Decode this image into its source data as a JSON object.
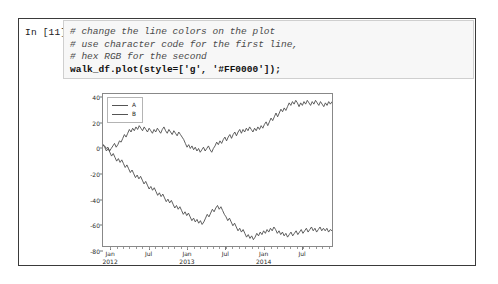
{
  "notebook": {
    "prompt_label": "In [11]:",
    "code": {
      "line1": "# change the line colors on the plot",
      "line2": "# use character code for the first line,",
      "line3": "# hex RGB for the second",
      "line4": "walk_df.plot(style=['g', '#FF0000']);"
    }
  },
  "chart_data": {
    "type": "line",
    "title": "",
    "xlabel": "",
    "ylabel": "",
    "ylim": [
      -80,
      40
    ],
    "yticks": [
      40,
      20,
      0,
      -20,
      -40,
      -60,
      -80
    ],
    "ytick_labels": [
      "40",
      "20",
      "0",
      "-20",
      "-40",
      "-60",
      "-80"
    ],
    "grid": false,
    "legend_position": "upper left",
    "xtick_labels": [
      "Jan\n2012",
      "Jul",
      "Jan\n2013",
      "Jul",
      "Jan\n2014",
      "Jul"
    ],
    "xtick_positions": [
      0.035,
      0.202,
      0.368,
      0.534,
      0.7,
      0.866
    ],
    "series": [
      {
        "name": "A",
        "color": "#4d4d4d",
        "values": [
          0,
          -1,
          -3,
          -2,
          -5,
          -3,
          -1,
          1,
          -2,
          0,
          3,
          2,
          5,
          8,
          6,
          9,
          12,
          10,
          13,
          11,
          14,
          12,
          15,
          13,
          11,
          14,
          12,
          10,
          13,
          11,
          9,
          12,
          10,
          13,
          11,
          9,
          12,
          14,
          11,
          9,
          12,
          10,
          8,
          11,
          9,
          7,
          10,
          8,
          6,
          4,
          1,
          -2,
          0,
          -3,
          -1,
          -4,
          -2,
          -5,
          -3,
          -6,
          -4,
          -2,
          -5,
          -3,
          -1,
          -4,
          -6,
          -3,
          -1,
          2,
          0,
          3,
          1,
          4,
          6,
          3,
          6,
          8,
          5,
          8,
          10,
          7,
          10,
          12,
          9,
          12,
          10,
          13,
          11,
          14,
          12,
          10,
          13,
          11,
          14,
          12,
          15,
          13,
          16,
          18,
          15,
          18,
          21,
          19,
          22,
          25,
          22,
          25,
          28,
          26,
          29,
          27,
          30,
          33,
          31,
          34,
          32,
          35,
          33,
          30,
          33,
          31,
          34,
          32,
          35,
          33,
          31,
          34,
          32,
          35,
          33,
          31,
          34,
          32,
          30,
          33,
          31,
          34,
          32,
          34
        ]
      },
      {
        "name": "B",
        "color": "#4d4d4d",
        "values": [
          0,
          -2,
          -5,
          -3,
          -6,
          -9,
          -7,
          -10,
          -13,
          -11,
          -14,
          -12,
          -15,
          -18,
          -16,
          -19,
          -22,
          -20,
          -23,
          -26,
          -24,
          -27,
          -25,
          -28,
          -31,
          -29,
          -32,
          -35,
          -33,
          -36,
          -34,
          -37,
          -40,
          -38,
          -41,
          -39,
          -42,
          -45,
          -43,
          -46,
          -44,
          -47,
          -50,
          -48,
          -51,
          -49,
          -52,
          -55,
          -53,
          -56,
          -54,
          -57,
          -60,
          -58,
          -61,
          -59,
          -62,
          -60,
          -63,
          -61,
          -58,
          -55,
          -57,
          -54,
          -51,
          -53,
          -50,
          -48,
          -51,
          -49,
          -52,
          -55,
          -57,
          -60,
          -58,
          -61,
          -64,
          -62,
          -65,
          -68,
          -66,
          -69,
          -67,
          -70,
          -73,
          -71,
          -74,
          -72,
          -75,
          -73,
          -70,
          -72,
          -69,
          -71,
          -68,
          -70,
          -67,
          -69,
          -66,
          -68,
          -65,
          -67,
          -70,
          -68,
          -71,
          -69,
          -72,
          -70,
          -73,
          -71,
          -69,
          -72,
          -70,
          -68,
          -71,
          -69,
          -67,
          -70,
          -68,
          -66,
          -69,
          -67,
          -65,
          -68,
          -66,
          -69,
          -67,
          -65,
          -68,
          -66,
          -68,
          -66,
          -69,
          -67,
          -68
        ]
      }
    ]
  }
}
